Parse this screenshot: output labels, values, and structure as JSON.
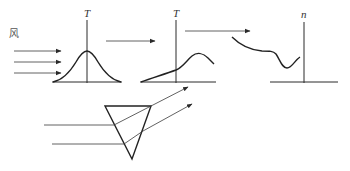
{
  "diagram": {
    "wind_label": "风",
    "panel1": {
      "axis_label": "T",
      "description": "symmetric bell-shaped temperature profile"
    },
    "panel2": {
      "axis_label": "T",
      "description": "skewed temperature profile, rising to a peak right of axis"
    },
    "panel3": {
      "axis_label": "n",
      "description": "refractive index profile with a dip near the axis"
    },
    "prism": {
      "description": "inverted triangular prism refracting two parallel rays upward"
    },
    "colors": {
      "line": "#2a2a2a",
      "background": "#ffffff"
    }
  }
}
